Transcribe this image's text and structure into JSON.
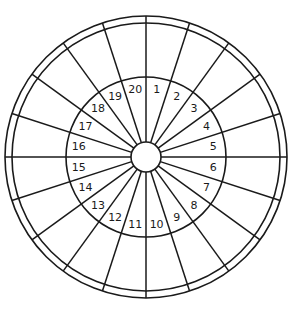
{
  "diagram": {
    "type": "sectored-circle",
    "sector_count": 20,
    "sector_labels": [
      "1",
      "2",
      "3",
      "4",
      "5",
      "6",
      "7",
      "8",
      "9",
      "10",
      "11",
      "12",
      "13",
      "14",
      "15",
      "16",
      "17",
      "18",
      "19",
      "20"
    ],
    "label_order": "clockwise starting right of top",
    "stroke_color": "#1a1a1a",
    "background_color": "#ffffff",
    "geometry": {
      "center": [
        146,
        157
      ],
      "hub_radius": 15,
      "label_ring_radius": 80,
      "outer_inner_radius": 134,
      "outer_radius": 141,
      "label_radius": 68,
      "first_spoke_angle_deg": 0,
      "spoke_step_deg": 18
    }
  }
}
